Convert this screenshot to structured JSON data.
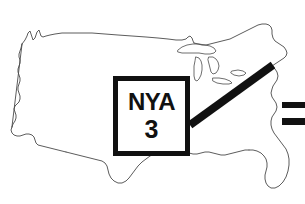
{
  "figure": {
    "kind": "route-marker-map",
    "background_color": "#ffffff",
    "ink_color": "#111111",
    "outline_color": "#4a4a4a",
    "width": 305,
    "height": 204
  },
  "map": {
    "name": "united-states-outline",
    "region_label": "Contiguous United States",
    "stroke_color": "#4a4a4a",
    "stroke_width": 0.9,
    "fill": "none",
    "features": [
      "mainland-outline",
      "great-lakes"
    ]
  },
  "callout": {
    "box_label": "route-shield",
    "code": "NYA",
    "number": "3",
    "border_color": "#111111",
    "border_width": 5,
    "fill_color": "#ffffff",
    "x": 113,
    "y": 76,
    "width": 77,
    "height": 80
  },
  "leader_line": {
    "name": "callout-leader-line",
    "color": "#111111",
    "width": 8,
    "from_x": 190,
    "from_y": 125,
    "to_x": 273,
    "to_y": 65,
    "points_to": "New England / New York"
  },
  "edge_bars": [
    {
      "name": "edge-bar-upper",
      "x": 282,
      "y": 102,
      "width": 23,
      "height": 6,
      "color": "#111111"
    },
    {
      "name": "edge-bar-lower",
      "x": 282,
      "y": 118,
      "width": 23,
      "height": 7,
      "color": "#111111"
    }
  ]
}
